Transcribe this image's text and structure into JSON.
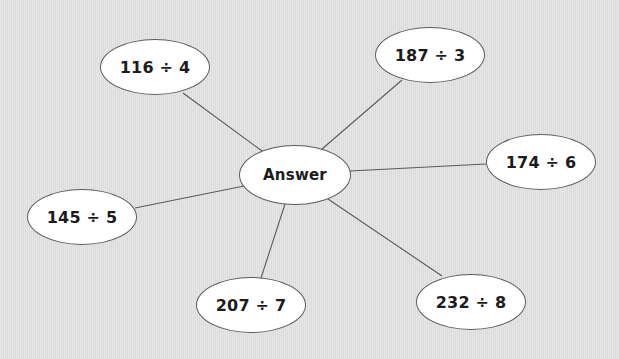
{
  "diagram": {
    "type": "spider-diagram",
    "center": {
      "label": "Answer",
      "cx": 295,
      "cy": 175,
      "rx": 56,
      "ry": 30
    },
    "nodes": [
      {
        "id": "116-div-4",
        "label": "116 ÷ 4",
        "cx": 155,
        "cy": 67,
        "rx": 55,
        "ry": 28
      },
      {
        "id": "187-div-3",
        "label": "187 ÷ 3",
        "cx": 430,
        "cy": 55,
        "rx": 55,
        "ry": 28
      },
      {
        "id": "174-div-6",
        "label": "174 ÷ 6",
        "cx": 541,
        "cy": 162,
        "rx": 55,
        "ry": 28
      },
      {
        "id": "145-div-5",
        "label": "145 ÷ 5",
        "cx": 82,
        "cy": 217,
        "rx": 55,
        "ry": 28
      },
      {
        "id": "207-div-7",
        "label": "207 ÷ 7",
        "cx": 251,
        "cy": 305,
        "rx": 55,
        "ry": 28
      },
      {
        "id": "232-div-8",
        "label": "232 ÷ 8",
        "cx": 471,
        "cy": 302,
        "rx": 55,
        "ry": 28
      }
    ],
    "edges": [
      {
        "from": "center",
        "to": "116-div-4",
        "x1": 262,
        "y1": 151,
        "x2": 183,
        "y2": 93
      },
      {
        "from": "center",
        "to": "187-div-3",
        "x1": 322,
        "y1": 149,
        "x2": 402,
        "y2": 80
      },
      {
        "from": "center",
        "to": "174-div-6",
        "x1": 350,
        "y1": 171,
        "x2": 486,
        "y2": 164
      },
      {
        "from": "center",
        "to": "145-div-5",
        "x1": 244,
        "y1": 186,
        "x2": 135,
        "y2": 208
      },
      {
        "from": "center",
        "to": "207-div-7",
        "x1": 285,
        "y1": 204,
        "x2": 261,
        "y2": 278
      },
      {
        "from": "center",
        "to": "232-div-8",
        "x1": 328,
        "y1": 199,
        "x2": 442,
        "y2": 276
      }
    ],
    "colors": {
      "background": "#e1e1e1",
      "node_fill": "#ffffff",
      "node_border": "#5c5c5c",
      "line": "#5a5a5a",
      "text": "#1c1c1c"
    }
  }
}
